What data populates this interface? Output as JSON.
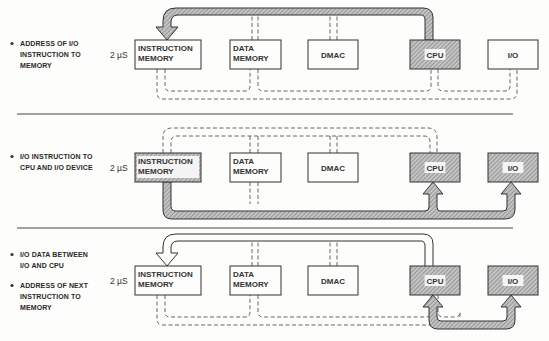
{
  "diagram": {
    "type": "bus-transfer-sequence",
    "colors": {
      "ink": "#333333",
      "hatch_bg": "#bdbdbd",
      "hatch_line": "#6a6a6a",
      "paper": "#fdfdfb"
    },
    "components": [
      "INSTRUCTION MEMORY",
      "DATA MEMORY",
      "DMAC",
      "CPU",
      "I/O"
    ],
    "panels": [
      {
        "id": "step-1",
        "notes": [
          "ADDRESS OF I/O INSTRUCTION TO MEMORY"
        ],
        "timing": "2 µS",
        "boxes": [
          {
            "name": "instruction-memory",
            "line1": "INSTRUCTION",
            "line2": "MEMORY",
            "highlighted": false
          },
          {
            "name": "data-memory",
            "line1": "DATA",
            "line2": "MEMORY",
            "highlighted": false
          },
          {
            "name": "dmac",
            "line1": "DMAC",
            "line2": "",
            "highlighted": false
          },
          {
            "name": "cpu",
            "line1": "CPU",
            "line2": "",
            "highlighted": true
          },
          {
            "name": "io",
            "line1": "I/O",
            "line2": "",
            "highlighted": false
          }
        ],
        "active_transfer": {
          "from": "CPU",
          "to": "INSTRUCTION MEMORY",
          "bus": "upper"
        }
      },
      {
        "id": "step-2",
        "notes": [
          "I/O INSTRUCTION TO CPU AND I/O DEVICE"
        ],
        "timing": "2 µS",
        "boxes": [
          {
            "name": "instruction-memory",
            "line1": "INSTRUCTION",
            "line2": "MEMORY",
            "highlighted": true
          },
          {
            "name": "data-memory",
            "line1": "DATA",
            "line2": "MEMORY",
            "highlighted": false
          },
          {
            "name": "dmac",
            "line1": "DMAC",
            "line2": "",
            "highlighted": false
          },
          {
            "name": "cpu",
            "line1": "CPU",
            "line2": "",
            "highlighted": true
          },
          {
            "name": "io",
            "line1": "I/O",
            "line2": "",
            "highlighted": true
          }
        ],
        "active_transfer": {
          "from": "INSTRUCTION MEMORY",
          "to": [
            "CPU",
            "I/O"
          ],
          "bus": "lower"
        }
      },
      {
        "id": "step-3",
        "notes": [
          "I/O DATA BETWEEN I/O AND CPU",
          "ADDRESS OF NEXT INSTRUCTION TO MEMORY"
        ],
        "timing": "2 µS",
        "boxes": [
          {
            "name": "instruction-memory",
            "line1": "INSTRUCTION",
            "line2": "MEMORY",
            "highlighted": false
          },
          {
            "name": "data-memory",
            "line1": "DATA",
            "line2": "MEMORY",
            "highlighted": false
          },
          {
            "name": "dmac",
            "line1": "DMAC",
            "line2": "",
            "highlighted": false
          },
          {
            "name": "cpu",
            "line1": "CPU",
            "line2": "",
            "highlighted": true
          },
          {
            "name": "io",
            "line1": "I/O",
            "line2": "",
            "highlighted": true
          }
        ],
        "active_transfer": {
          "from": [
            "CPU",
            "I/O"
          ],
          "to": [
            "I/O",
            "CPU",
            "INSTRUCTION MEMORY"
          ],
          "bus": "upper-open + lower"
        }
      }
    ]
  }
}
